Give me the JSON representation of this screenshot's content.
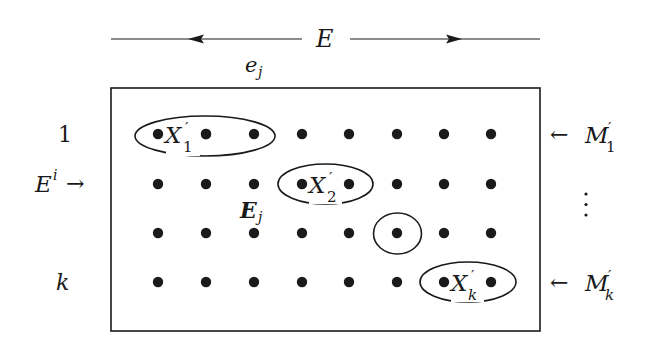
{
  "diagram": {
    "top_label": "E",
    "top_sublabel": {
      "base": "e",
      "sub": "j"
    },
    "left_labels": [
      {
        "text": "1",
        "row": 0
      },
      {
        "base": "E",
        "sup": "i",
        "arrow": "→",
        "row": 1
      },
      {
        "text": "k",
        "row": 3
      }
    ],
    "right_labels": [
      {
        "arrow": "←",
        "base": "M",
        "prime": "′",
        "sub": "1",
        "row": 0
      },
      {
        "vdots": "⋮"
      },
      {
        "arrow": "←",
        "base": "M",
        "prime": "′",
        "sub": "k",
        "row": 3
      }
    ],
    "inner_label": {
      "base": "E",
      "sub": "j"
    },
    "grid": {
      "rows": 4,
      "cols": 8
    },
    "groups": [
      {
        "label_base": "X",
        "label_prime": "′",
        "label_sub": "1",
        "row": 0,
        "cols": [
          0,
          1,
          2
        ]
      },
      {
        "label_base": "X",
        "label_prime": "′",
        "label_sub": "2",
        "row": 1,
        "cols": [
          3,
          4
        ]
      },
      {
        "label_base": "",
        "row": 2,
        "cols": [
          5
        ]
      },
      {
        "label_base": "X",
        "label_prime": "′",
        "label_sub": "k",
        "row": 3,
        "cols": [
          6,
          7
        ]
      }
    ],
    "colors": {
      "ink": "#1a1a1a",
      "background": "#ffffff"
    }
  }
}
